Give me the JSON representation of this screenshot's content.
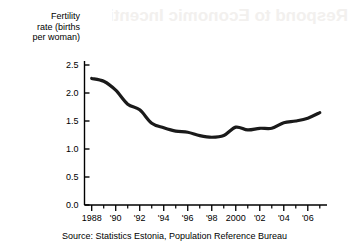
{
  "figure": {
    "source_note": "Source:  Statistics Estonia, Population Reference Bureau",
    "bleed_through_text": "Respond to Economic Incentives"
  },
  "chart_data": {
    "type": "line",
    "title": "",
    "xlabel": "",
    "ylabel": "Fertility\nrate (births\nper woman)",
    "xlim": [
      1987.4,
      2007.6
    ],
    "ylim": [
      0.0,
      2.75
    ],
    "grid": false,
    "legend": null,
    "y_ticks": [
      0.0,
      0.5,
      1.0,
      1.5,
      2.0,
      2.5
    ],
    "y_tick_labels": [
      "0.0",
      "0.5",
      "1.0",
      "1.5",
      "2.0",
      "2.5"
    ],
    "x_ticks": [
      1988,
      1990,
      1992,
      1994,
      1996,
      1998,
      2000,
      2002,
      2004,
      2006
    ],
    "x_tick_labels": [
      "1988",
      "'90",
      "'92",
      "'94",
      "'96",
      "'98",
      "2000",
      "'02",
      "'04",
      "'06"
    ],
    "x_minor_ticks": [
      1989,
      1991,
      1993,
      1995,
      1997,
      1999,
      2001,
      2003,
      2005,
      2007
    ],
    "line_color": "#1a1a1a",
    "line_width": 3.2,
    "x": [
      1988,
      1989,
      1990,
      1991,
      1992,
      1993,
      1994,
      1995,
      1996,
      1997,
      1998,
      1999,
      2000,
      2001,
      2002,
      2003,
      2004,
      2005,
      2006,
      2007
    ],
    "values": [
      2.26,
      2.21,
      2.05,
      1.8,
      1.7,
      1.46,
      1.38,
      1.32,
      1.3,
      1.24,
      1.21,
      1.24,
      1.39,
      1.34,
      1.37,
      1.37,
      1.47,
      1.5,
      1.55,
      1.65
    ],
    "series_name": "Fertility rate"
  }
}
